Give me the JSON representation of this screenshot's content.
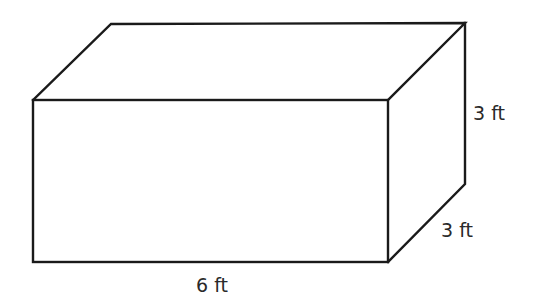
{
  "figure": {
    "type": "rectangular-prism",
    "labels": {
      "length": "6 ft",
      "height": "3 ft",
      "depth": "3 ft"
    },
    "dimensions": {
      "length_ft": 6,
      "height_ft": 3,
      "depth_ft": 3
    }
  }
}
